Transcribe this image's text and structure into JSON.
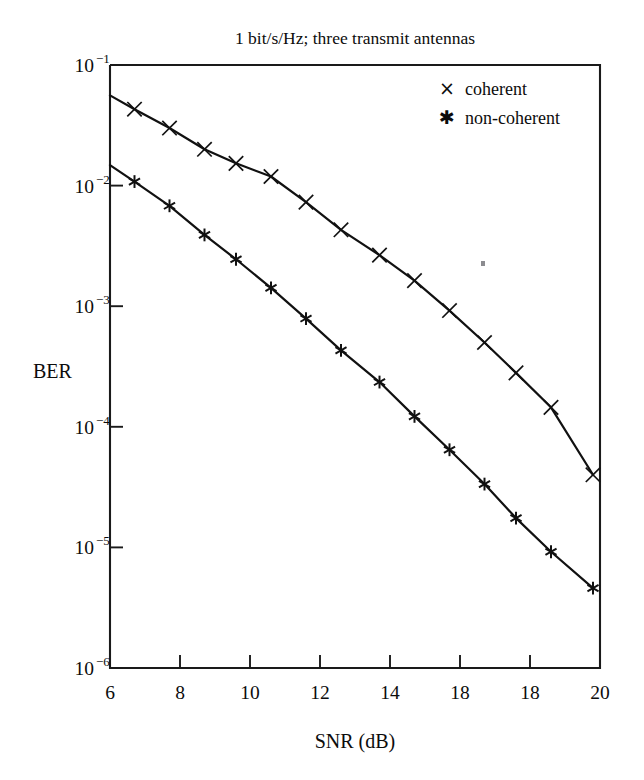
{
  "chart_data": {
    "type": "line",
    "title": "1 bit/s/Hz; three transmit antennas",
    "xlabel": "SNR (dB)",
    "ylabel": "BER",
    "xlim": [
      6,
      20
    ],
    "ylim": [
      1e-06,
      0.1
    ],
    "yscale": "log",
    "xscale": "linear",
    "grid": false,
    "legend_position": "top-right inside plot",
    "x_tick_values": [
      6,
      8,
      10,
      12,
      14,
      16,
      18,
      20
    ],
    "x_tick_labels": [
      "6",
      "8",
      "10",
      "12",
      "14",
      "18",
      "18",
      "20"
    ],
    "y_tick_values": [
      0.1,
      0.01,
      0.001,
      0.0001,
      1e-05,
      1e-06
    ],
    "y_tick_labels": [
      {
        "base": "10",
        "exp": "−1"
      },
      {
        "base": "10",
        "exp": "−2"
      },
      {
        "base": "10",
        "exp": "−3"
      },
      {
        "base": "10",
        "exp": "−4"
      },
      {
        "base": "10",
        "exp": "−5"
      },
      {
        "base": "10",
        "exp": "−6"
      }
    ],
    "series": [
      {
        "name": "coherent",
        "marker": "x",
        "marker_label": "×",
        "color": "#111111",
        "x": [
          6.0,
          6.7,
          7.7,
          8.7,
          9.6,
          10.6,
          11.6,
          12.6,
          13.7,
          14.7,
          15.7,
          16.7,
          17.6,
          18.6,
          19.8
        ],
        "y": [
          0.056,
          0.043,
          0.03,
          0.02,
          0.0153,
          0.0119,
          0.0073,
          0.0043,
          0.00265,
          0.00163,
          0.00092,
          0.0005,
          0.00028,
          0.000145,
          4e-05
        ]
      },
      {
        "name": "non-coherent",
        "marker": "asterisk",
        "marker_label": "✱",
        "color": "#111111",
        "x": [
          6.0,
          6.7,
          7.7,
          8.7,
          9.6,
          10.6,
          11.6,
          12.6,
          13.7,
          14.7,
          15.7,
          16.7,
          17.6,
          18.6,
          19.8
        ],
        "y": [
          0.0148,
          0.0108,
          0.0068,
          0.0039,
          0.00245,
          0.00142,
          0.00079,
          0.00043,
          0.000235,
          0.000122,
          6.45e-05,
          3.35e-05,
          1.75e-05,
          9.2e-06,
          4.6e-06
        ]
      }
    ],
    "legend": [
      {
        "marker": "×",
        "label": "coherent"
      },
      {
        "marker": "✱",
        "label": "non-coherent"
      }
    ]
  }
}
